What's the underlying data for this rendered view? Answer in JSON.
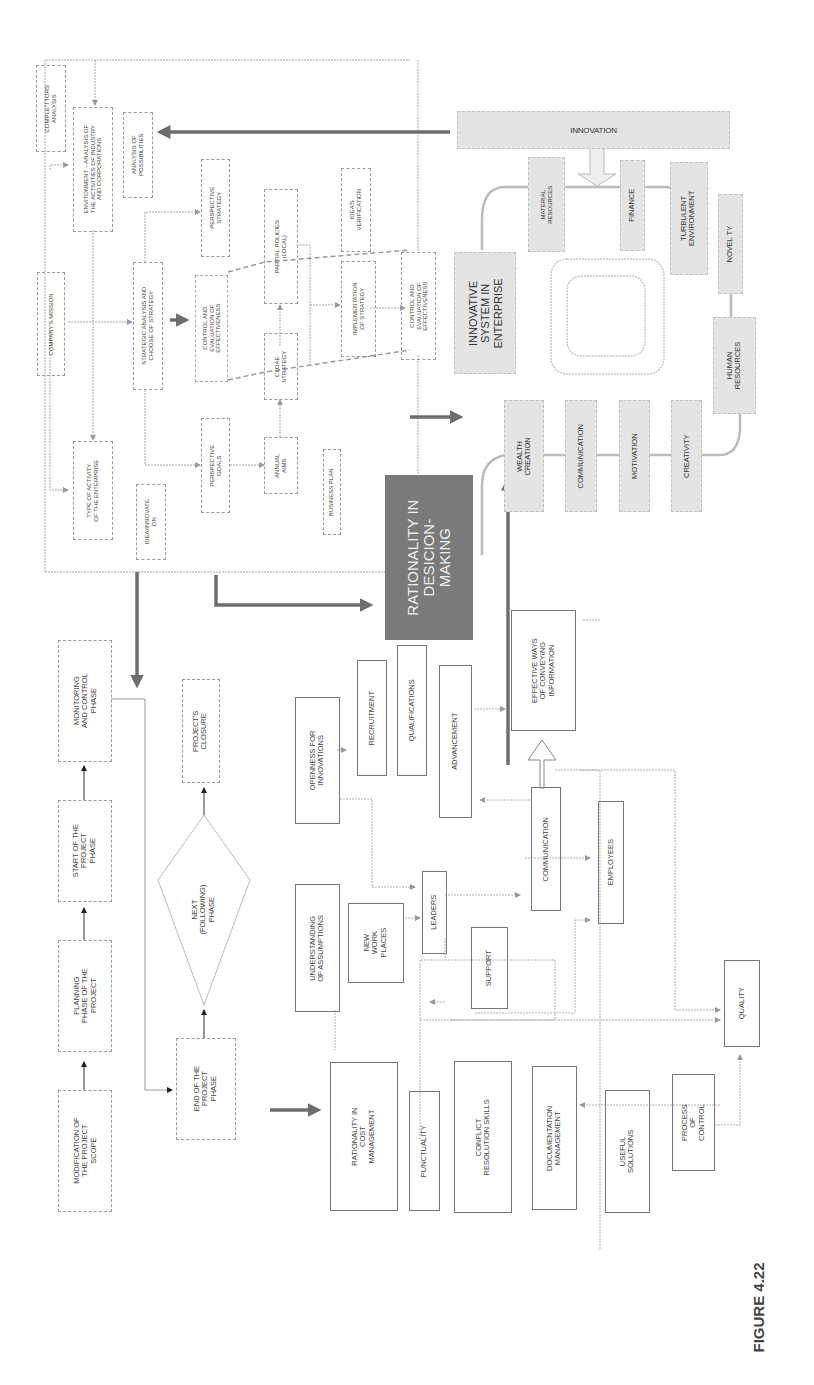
{
  "figure": {
    "caption": "FIGURE 4.22",
    "orientation": "rotated-90-ccw"
  },
  "strategy_section": {
    "competitors_analysis": "COMPLE\"TTORS\nANALYSIS",
    "environment": "ENVITONMENT – ANALYSIS OF\nTHE ACTIVITIES OF INDUSTRY\nAND CORPORATIONS",
    "analysis_possibilities": "ANALYSIS OF\nPOSSIBILITIES",
    "company_mission": "COMPANY'S MISSION",
    "type_of_activity": "TYPE OF ACTIVITY\nOF THE ENTERPRISE",
    "strategic_analysis": "STRATEGIC ANALYSIS AND\nCHOOSE OF STRATEGY",
    "perspective_strategy": "PERSPECTIVE\nSTRATEGY",
    "control_eval_dashed": "CONTROL AND\nEVALUATION OF\nEFFECTIVENESS",
    "partial_policies": "PARTIAL POLICIES\n(LOCAL)",
    "ideas_verification": "IDEA'S\nVERIFICATION",
    "cloae_strategy": "CLOAE\nSTRATEGY",
    "implementation": "IMPLEMENTATION\nOF STRATEGY",
    "control_eval": "CONTROL AND\nEVALUATION OF\nEFFECTIVENESS",
    "perspective_goals": "PERSPECTIVE\nGOALS",
    "annual_aims": "ANNUAL\nAIMS",
    "idea_innovation": "IDEA/INNOVATE\nON",
    "business_plan": "BUSINESS PLAN"
  },
  "innovation_section": {
    "innovation": "INNOVATION",
    "material_resources": "MATERIAL\nRESOURCES",
    "finance": "FINANCE",
    "turbulent_environment": "TURBULENT\nENVIRONMENT",
    "novelty": "NOVEL TY",
    "innovative_system": "INNOVATIVE\nSYSTEM IN\nENTERPRISE",
    "human_resources": "HUMAN\nRESOURCES",
    "wealth_creation": "WEALTH\nCREATION",
    "communication": "COMMUNICATION",
    "motivation": "MOTIVATION",
    "creativity": "CREATIVITY"
  },
  "center": {
    "rationality_decision": "RATIONALITY IN\nDESICION-\nMAKING"
  },
  "project_phases": {
    "modification": "MODIFICATION OF\nTHE PROJECT\nSCOPE",
    "planning": "PLANNING\nPHASE OF THE\nPROJECT",
    "start": "START OF THE\nPROJECT\nPHASE",
    "monitoring": "MONITORING\nAND CONTROL\nPHASE",
    "end": "END OF THE\nPROJECT\nPHASE",
    "next_phase": "NEXT\n(FOLLOWING)\nPHASE",
    "closure": "PROJECT'S\nCLOSURE"
  },
  "management_section": {
    "openness": "OPENNESS FOR\nINNOVATIONS",
    "recruitment": "RECRUITMENT",
    "qualifications": "QUALIFICATIONS",
    "advancement": "ADVANCEMENT",
    "effective_ways": "EFFECTIVE WAYS\nOF CONVEYING\nINFORMATION",
    "understanding": "UNDERSTANDING\nOF ASSUMPTIONS",
    "new_work_places": "NEW\nWORK\nPLACES",
    "leaders": "LEADERS",
    "communication": "COMMUNICATION",
    "employees": "EMPLOYEES",
    "support": "SUPPORT",
    "rationality_cost": "RATIONALITY IN\nCOST\nMANAGEMENT",
    "punctuality": "PUNCTUALITY",
    "conflict_resolution": "CONFLICT\nRESOLUTION SKILLS",
    "documentation": "DOCUMENTATION\nMANAGEMENT",
    "useful_solutions": "USEFUL\nSOLUTIONS",
    "process_of_control": "PROCESS\nOF\nCONTROL",
    "quality": "QUALITY"
  },
  "colors": {
    "thin_line": "#a8a8a8",
    "thick_arrow": "#6e6e6e",
    "dark_box": "#7a7a7a",
    "shaded_box": "#e4e4e4"
  }
}
